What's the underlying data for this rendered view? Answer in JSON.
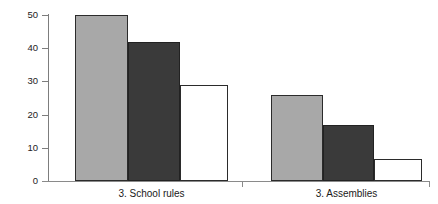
{
  "chart_data": {
    "type": "bar",
    "title": "",
    "xlabel": "",
    "ylabel": "% 'yes' replies",
    "ylim": [
      0,
      50
    ],
    "yticks": [
      0,
      10,
      20,
      30,
      40,
      50
    ],
    "ytick_labels": [
      "0",
      "10",
      "20",
      "30",
      "40",
      "50"
    ],
    "grid": false,
    "legend": "none",
    "categories": [
      "3. School rules",
      "3. Assemblies"
    ],
    "series": [
      {
        "name": "series-1-light-gray",
        "color": "#a8a8a8",
        "values": [
          50,
          26
        ]
      },
      {
        "name": "series-2-dark-gray",
        "color": "#3a3a3a",
        "values": [
          42,
          17
        ]
      },
      {
        "name": "series-3-white",
        "color": "#ffffff",
        "values": [
          29,
          6.5
        ]
      }
    ]
  },
  "axis": {
    "y_title": "% 'yes' replies",
    "y_labels": [
      "50",
      "40",
      "30",
      "20",
      "10",
      "0"
    ]
  },
  "categories": {
    "first": "3. School rules",
    "second": "3. Assemblies"
  }
}
